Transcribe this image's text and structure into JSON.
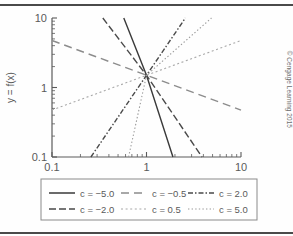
{
  "chart_data": {
    "type": "line",
    "title": "",
    "xlabel": "x",
    "ylabel": "y = f(x)",
    "xscale": "log",
    "yscale": "log",
    "xlim": [
      0.1,
      10
    ],
    "ylim": [
      0.1,
      10
    ],
    "xticks": [
      0.1,
      1,
      10
    ],
    "xtick_labels": [
      "0.1",
      "1",
      "10"
    ],
    "yticks": [
      0.1,
      1,
      10
    ],
    "ytick_labels": [
      "0.1",
      "1",
      "10"
    ],
    "grid": false,
    "minor_ticks": true,
    "legend_position": "below",
    "legend_columns": 3,
    "annotation": "all curves pass through (1, 1.5)",
    "common_point": {
      "x": 1,
      "y": 1.5
    },
    "series": [
      {
        "name": "c = -5.0",
        "c": -5.0,
        "style": "solid",
        "color": "#3a3a3a",
        "x": [
          0.575,
          1.0,
          1.905
        ],
        "y": [
          10.0,
          1.5,
          0.1
        ]
      },
      {
        "name": "c = -2.0",
        "c": -2.0,
        "style": "dashed",
        "color": "#4a4a4a",
        "x": [
          0.345,
          1.0,
          3.873
        ],
        "y": [
          10.0,
          1.5,
          0.1
        ]
      },
      {
        "name": "c = -0.5",
        "c": -0.5,
        "style": "dashed-long",
        "color": "#8c8c8c",
        "x": [
          0.1,
          1.0,
          10.0
        ],
        "y": [
          4.743,
          1.5,
          0.474
        ]
      },
      {
        "name": "c = 0.5",
        "c": 0.5,
        "style": "dotted",
        "color": "#a8a8a8",
        "x": [
          0.1,
          1.0,
          10.0
        ],
        "y": [
          0.474,
          1.5,
          4.743
        ]
      },
      {
        "name": "c = 2.0",
        "c": 2.0,
        "style": "dash-dot",
        "color": "#4a4a4a",
        "x": [
          0.258,
          1.0,
          2.579
        ],
        "y": [
          0.1,
          1.5,
          10.0
        ]
      },
      {
        "name": "c = 5.0",
        "c": 5.0,
        "style": "dotted-fine",
        "color": "#9a9a9a",
        "x": [
          0.646,
          1.0,
          4.87
        ],
        "y": [
          0.1,
          1.5,
          10.0
        ]
      }
    ]
  },
  "legend": {
    "entries": [
      {
        "label": "c = −5.0"
      },
      {
        "label": "c = −0.5"
      },
      {
        "label": "c = 2.0"
      },
      {
        "label": "c = −2.0"
      },
      {
        "label": "c = 0.5"
      },
      {
        "label": "c = 5.0"
      }
    ]
  },
  "credit": "© Cengage Learning 2015"
}
